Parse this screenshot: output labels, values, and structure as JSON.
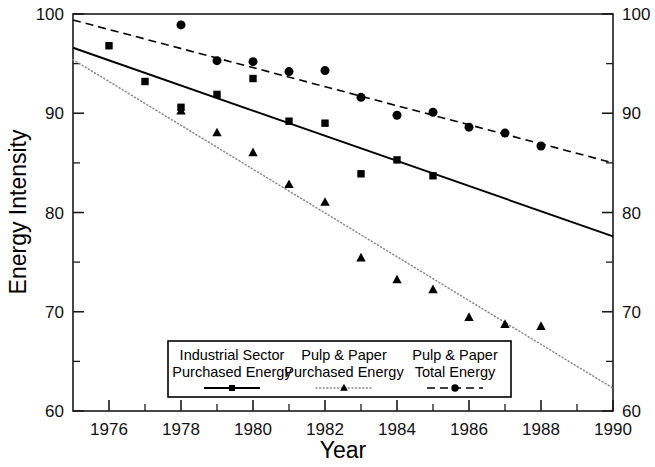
{
  "chart_data": {
    "type": "scatter",
    "title": "",
    "xlabel": "Year",
    "ylabel": "Energy Intensity",
    "xlim": [
      1975,
      1990
    ],
    "ylim": [
      60,
      100
    ],
    "x_ticks_major": [
      1976,
      1978,
      1980,
      1982,
      1984,
      1986,
      1988,
      1990
    ],
    "x_tick_labels": [
      "1976",
      "1978",
      "1980",
      "1982",
      "1984",
      "1986",
      "1988",
      "1990"
    ],
    "x_ticks_minor": [
      1975,
      1977,
      1979,
      1981,
      1983,
      1985,
      1987,
      1989
    ],
    "y_ticks_major": [
      60,
      70,
      80,
      90,
      100
    ],
    "y_tick_labels": [
      "60",
      "70",
      "80",
      "90",
      "100"
    ],
    "y_ticks_minor": [
      65,
      75,
      85,
      95
    ],
    "grid": false,
    "legend_position": "bottom-center",
    "right_axis_mirrored": true,
    "series": [
      {
        "name": "Industrial Sector Purchased Energy",
        "marker": "square",
        "line_style": "solid",
        "color": "#000000",
        "x": [
          1976,
          1977,
          1978,
          1979,
          1980,
          1981,
          1982,
          1983,
          1984,
          1985
        ],
        "values": [
          96.8,
          93.2,
          90.6,
          91.9,
          93.5,
          89.2,
          89.0,
          83.9,
          85.3,
          83.7
        ],
        "trend_endpoints": {
          "x": [
            1975,
            1990
          ],
          "y": [
            96.6,
            77.6
          ]
        }
      },
      {
        "name": "Pulp & Paper Purchased Energy",
        "marker": "triangle",
        "line_style": "dotted",
        "color": "#888888",
        "x": [
          1978,
          1979,
          1980,
          1981,
          1982,
          1983,
          1984,
          1985,
          1986,
          1987,
          1988
        ],
        "values": [
          90.2,
          88.0,
          86.0,
          82.8,
          81.0,
          75.4,
          73.2,
          72.2,
          69.4,
          68.7,
          68.5
        ],
        "trend_endpoints": {
          "x": [
            1975,
            1990
          ],
          "y": [
            95.4,
            62.3
          ]
        }
      },
      {
        "name": "Pulp & Paper Total Energy",
        "marker": "circle",
        "line_style": "dashed",
        "color": "#000000",
        "x": [
          1978,
          1979,
          1980,
          1981,
          1982,
          1983,
          1984,
          1985,
          1986,
          1987,
          1988
        ],
        "values": [
          98.9,
          95.3,
          95.2,
          94.2,
          94.3,
          91.6,
          89.8,
          90.1,
          88.6,
          88.0,
          86.7
        ],
        "trend_endpoints": {
          "x": [
            1975,
            1990
          ],
          "y": [
            99.4,
            85.0
          ]
        }
      }
    ]
  },
  "legend": {
    "entries": [
      {
        "line1": "Industrial Sector",
        "line2": "Purchased Energy",
        "marker": "square",
        "line_style": "solid"
      },
      {
        "line1": "Pulp & Paper",
        "line2": "Purchased Energy",
        "marker": "triangle",
        "line_style": "dotted"
      },
      {
        "line1": "Pulp & Paper",
        "line2": "Total Energy",
        "marker": "circle",
        "line_style": "dashed"
      }
    ]
  }
}
